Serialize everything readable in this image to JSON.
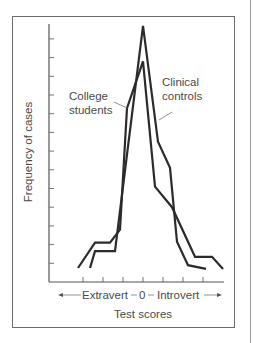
{
  "chart_data": {
    "type": "line",
    "title": "",
    "xlabel": "Test scores",
    "ylabel": "Frequency of cases",
    "x_axis_direction_label": {
      "left": "Extravert",
      "center": "0",
      "right": "Introvert"
    },
    "x_ticks": [
      -3,
      -2,
      -1,
      0,
      1,
      2,
      3
    ],
    "y_ticks_count": 13,
    "ylim": [
      0,
      13.6
    ],
    "xlim": [
      -3.3,
      3.6
    ],
    "grid": false,
    "legend": "inline annotations",
    "series": [
      {
        "name": "College students",
        "points": [
          [
            -3.25,
            0.75
          ],
          [
            -2.4,
            2.1
          ],
          [
            -1.65,
            2.1
          ],
          [
            -1.15,
            2.8
          ],
          [
            -0.8,
            9.3
          ],
          [
            0.0,
            11.8
          ],
          [
            0.6,
            5.1
          ],
          [
            1.45,
            4.0
          ],
          [
            2.6,
            1.35
          ],
          [
            3.45,
            1.35
          ],
          [
            4.0,
            0.7
          ]
        ]
      },
      {
        "name": "Clinical controls",
        "points": [
          [
            -2.65,
            0.75
          ],
          [
            -2.4,
            1.65
          ],
          [
            -1.4,
            1.65
          ],
          [
            0.0,
            13.7
          ],
          [
            0.75,
            7.5
          ],
          [
            1.35,
            6.1
          ],
          [
            1.7,
            2.15
          ],
          [
            2.25,
            0.9
          ],
          [
            3.15,
            0.7
          ]
        ]
      }
    ],
    "annotations": [
      {
        "text": "College students",
        "target_series": "College students"
      },
      {
        "text": "Clinical controls",
        "target_series": "Clinical controls"
      }
    ]
  },
  "labels": {
    "college_line1": "College",
    "college_line2": "students",
    "clinical_line1": "Clinical",
    "clinical_line2": "controls",
    "extravert": "Extravert",
    "zero": "0",
    "introvert": "Introvert",
    "xlabel": "Test scores",
    "ylabel": "Frequency of cases"
  }
}
